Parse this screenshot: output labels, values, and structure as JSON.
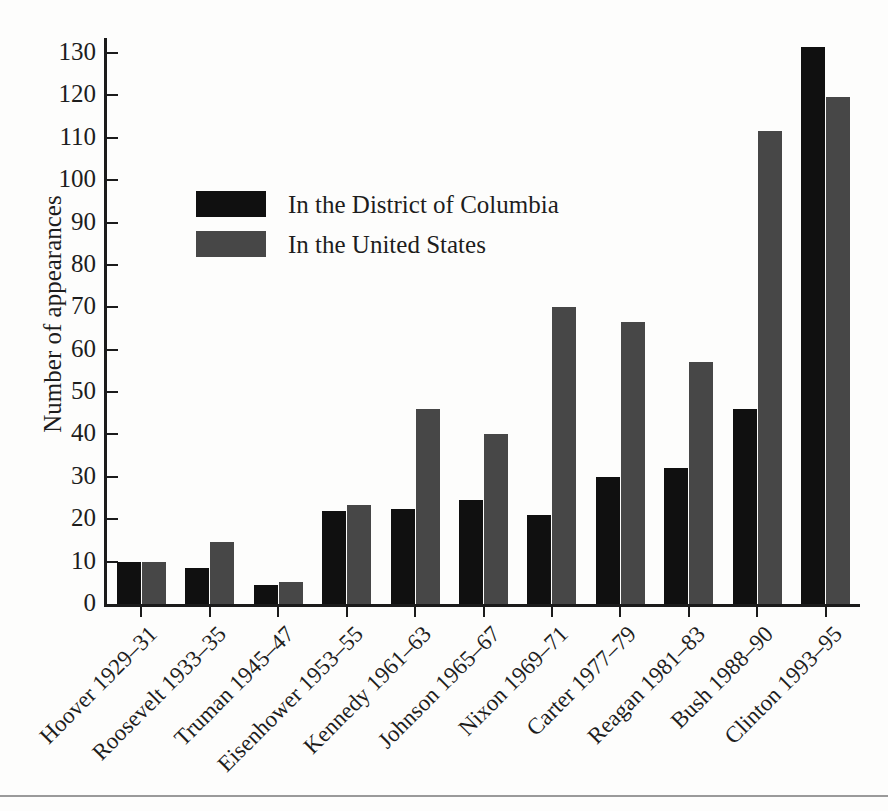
{
  "chart_data": {
    "type": "bar",
    "title": "",
    "xlabel": "",
    "ylabel": "Number of appearances",
    "ylim": [
      0,
      135
    ],
    "ytick_step": 10,
    "grid": false,
    "legend_position": "upper-left-inside",
    "categories": [
      "Hoover 1929–31",
      "Roosevelt 1933–35",
      "Truman 1945–47",
      "Eisenhower 1953–55",
      "Kennedy 1961–63",
      "Johnson 1965–67",
      "Nixon 1969–71",
      "Carter 1977–79",
      "Reagan 1981–83",
      "Bush 1988–90",
      "Clinton 1993–95"
    ],
    "yticks": [
      0,
      10,
      20,
      30,
      40,
      50,
      60,
      70,
      80,
      90,
      100,
      110,
      120,
      130
    ],
    "series": [
      {
        "name": "In the District of Columbia",
        "color": "#101010",
        "values": [
          10,
          8.5,
          4.5,
          22,
          22.5,
          24.5,
          21,
          30,
          32,
          46,
          131.5
        ]
      },
      {
        "name": "In the United States",
        "color": "#474747",
        "values": [
          10,
          14.7,
          5.3,
          23.3,
          46,
          40,
          70,
          66.5,
          57,
          111.5,
          119.5
        ]
      }
    ]
  },
  "legend": {
    "items": [
      {
        "label": "In the District of Columbia",
        "swatch": "dc"
      },
      {
        "label": "In the United States",
        "swatch": "us"
      }
    ]
  }
}
